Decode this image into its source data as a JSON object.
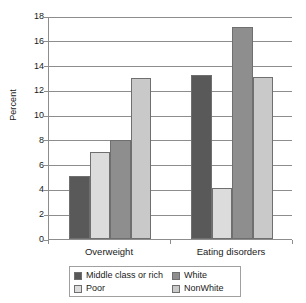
{
  "chart_data": {
    "type": "bar",
    "title": "",
    "xlabel": "",
    "ylabel": "Percent",
    "ylim": [
      0,
      18
    ],
    "ytick_step": 2,
    "yticks": [
      18,
      16,
      14,
      12,
      10,
      8,
      6,
      4,
      2,
      0
    ],
    "grid": true,
    "legend_position": "bottom",
    "categories": [
      "Overweight",
      "Eating disorders"
    ],
    "series": [
      {
        "name": "Middle class or rich",
        "color": "#595959",
        "values": [
          5.1,
          13.2
        ]
      },
      {
        "name": "Poor",
        "color": "#dcdcdc",
        "values": [
          7.0,
          4.1
        ]
      },
      {
        "name": "White",
        "color": "#8e8e8e",
        "values": [
          8.0,
          17.1
        ]
      },
      {
        "name": "NonWhite",
        "color": "#c9c9c9",
        "values": [
          13.0,
          13.1
        ]
      }
    ]
  },
  "axis": {
    "y_title": "Percent",
    "y_tick_labels": [
      "18",
      "16",
      "14",
      "12",
      "10",
      "8",
      "6",
      "4",
      "2",
      "0"
    ],
    "x_tick_labels": [
      "Overweight",
      "Eating disorders"
    ]
  },
  "legend": {
    "items": [
      {
        "label": "Middle class or rich",
        "color": "#595959"
      },
      {
        "label": "White",
        "color": "#8e8e8e"
      },
      {
        "label": "Poor",
        "color": "#dcdcdc"
      },
      {
        "label": "NonWhite",
        "color": "#c9c9c9"
      }
    ]
  }
}
